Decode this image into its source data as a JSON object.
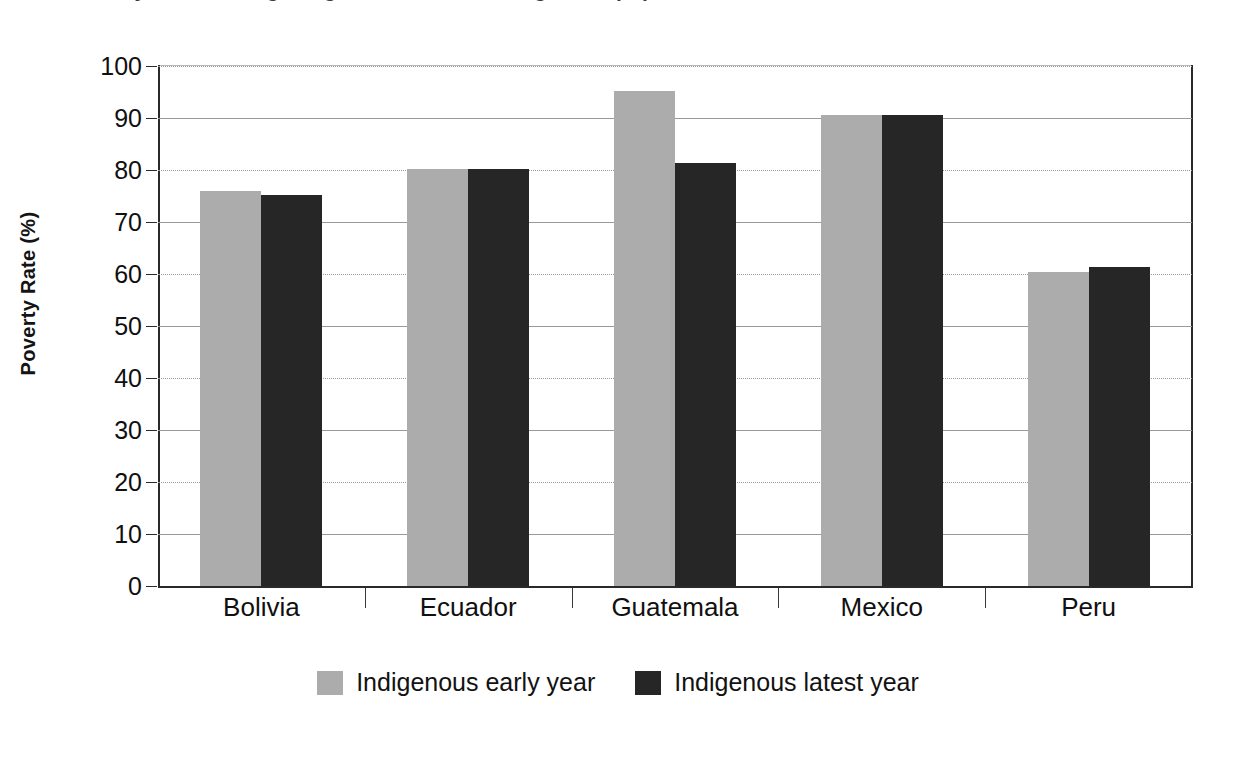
{
  "chart_data": {
    "type": "bar",
    "title": "Poverty rates among indigenous and non-indigenous populations",
    "xlabel": "",
    "ylabel": "Poverty Rate (%)",
    "ylim": [
      0,
      100
    ],
    "ytick_step": 10,
    "yticks": [
      100,
      90,
      80,
      70,
      60,
      50,
      40,
      30,
      20,
      10,
      0
    ],
    "grid": true,
    "legend_position": "bottom-center",
    "categories": [
      "Bolivia",
      "Ecuador",
      "Guatemala",
      "Mexico",
      "Peru"
    ],
    "series": [
      {
        "name": "Indigenous early year",
        "color": "#acacac",
        "values": [
          76.0,
          80.2,
          95.2,
          90.5,
          60.4
        ]
      },
      {
        "name": "Indigenous latest year",
        "color": "#262626",
        "values": [
          75.1,
          80.2,
          81.3,
          90.5,
          61.4
        ]
      }
    ]
  },
  "axes": {
    "y_axis_title": "Poverty Rate (%)",
    "y_tick_labels": [
      "100",
      "90",
      "80",
      "70",
      "60",
      "50",
      "40",
      "30",
      "20",
      "10",
      "0"
    ],
    "x_tick_labels": [
      "Bolivia",
      "Ecuador",
      "Guatemala",
      "Mexico",
      "Peru"
    ]
  },
  "legend": {
    "items": [
      {
        "label": "Indigenous early year",
        "color": "#acacac"
      },
      {
        "label": "Indigenous latest year",
        "color": "#262626"
      }
    ]
  },
  "colors": {
    "series_early": "#acacac",
    "series_latest": "#262626",
    "axis": "#2a2a2a",
    "grid": "#9a9a9a",
    "background": "#ffffff"
  }
}
